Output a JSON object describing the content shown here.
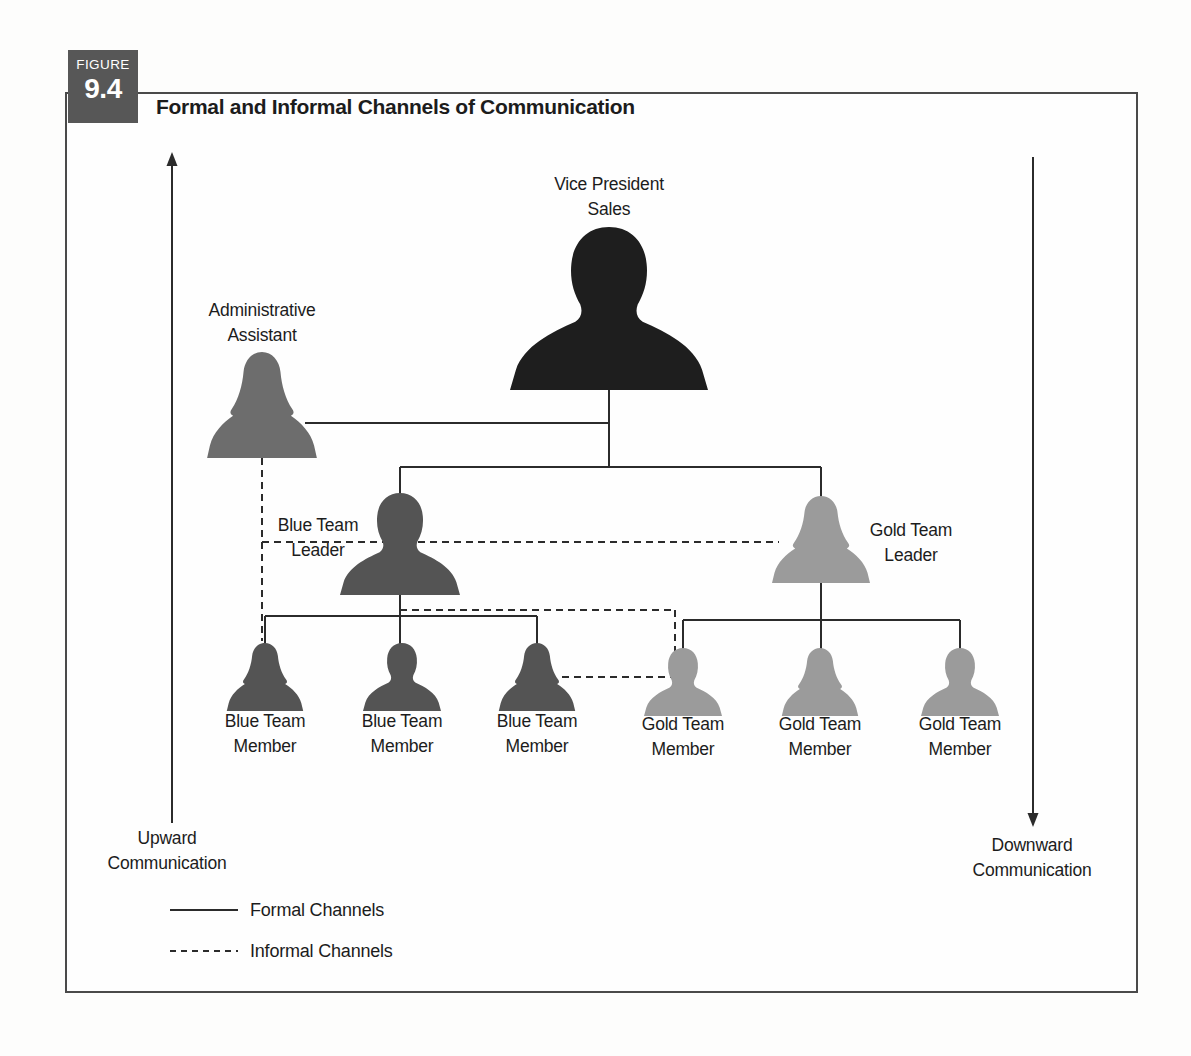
{
  "figure": {
    "label": "FIGURE",
    "number": "9.4",
    "title": "Formal and Informal Channels of Communication"
  },
  "colors": {
    "vp": "#1e1e1e",
    "admin": "#6d6d6d",
    "blue": "#545454",
    "gold": "#9b9b9b",
    "line": "#2b2b2b",
    "badge_bg": "#575757",
    "badge_text": "#ffffff"
  },
  "diagram": {
    "people": [
      {
        "id": "vp-sales",
        "role": "Vice President Sales",
        "gender": "male",
        "color": "vp",
        "cx": 609,
        "top": 227,
        "w": 198,
        "h": 163
      },
      {
        "id": "admin-assistant",
        "role": "Administrative Assistant",
        "gender": "female",
        "color": "admin",
        "cx": 262,
        "top": 352,
        "w": 112,
        "h": 106
      },
      {
        "id": "blue-team-leader",
        "role": "Blue Team Leader",
        "gender": "male",
        "color": "blue",
        "cx": 400,
        "top": 493,
        "w": 120,
        "h": 102
      },
      {
        "id": "gold-team-leader",
        "role": "Gold Team Leader",
        "gender": "female",
        "color": "gold",
        "cx": 821,
        "top": 496,
        "w": 100,
        "h": 87
      },
      {
        "id": "blue-team-member-1",
        "role": "Blue Team Member",
        "gender": "female",
        "color": "blue",
        "cx": 265,
        "top": 643,
        "w": 78,
        "h": 68
      },
      {
        "id": "blue-team-member-2",
        "role": "Blue Team Member",
        "gender": "male",
        "color": "blue",
        "cx": 402,
        "top": 643,
        "w": 78,
        "h": 68
      },
      {
        "id": "blue-team-member-3",
        "role": "Blue Team Member",
        "gender": "female",
        "color": "blue",
        "cx": 537,
        "top": 643,
        "w": 78,
        "h": 68
      },
      {
        "id": "gold-team-member-1",
        "role": "Gold Team Member",
        "gender": "male",
        "color": "gold",
        "cx": 683,
        "top": 648,
        "w": 78,
        "h": 68
      },
      {
        "id": "gold-team-member-2",
        "role": "Gold Team Member",
        "gender": "female",
        "color": "gold",
        "cx": 820,
        "top": 648,
        "w": 78,
        "h": 68
      },
      {
        "id": "gold-team-member-3",
        "role": "Gold Team Member",
        "gender": "male",
        "color": "gold",
        "cx": 960,
        "top": 648,
        "w": 78,
        "h": 68
      }
    ],
    "labels": [
      {
        "id": "vp-sales",
        "lines": [
          "Vice President",
          "Sales"
        ],
        "cx": 609,
        "top": 172
      },
      {
        "id": "admin-assistant",
        "lines": [
          "Administrative",
          "Assistant"
        ],
        "cx": 262,
        "top": 298
      },
      {
        "id": "blue-team-leader",
        "lines": [
          "Blue Team",
          "Leader"
        ],
        "cx": 318,
        "top": 513
      },
      {
        "id": "gold-team-leader",
        "lines": [
          "Gold Team",
          "Leader"
        ],
        "cx": 911,
        "top": 518
      },
      {
        "id": "blue-team-member-1",
        "lines": [
          "Blue Team",
          "Member"
        ],
        "cx": 265,
        "top": 709
      },
      {
        "id": "blue-team-member-2",
        "lines": [
          "Blue Team",
          "Member"
        ],
        "cx": 402,
        "top": 709
      },
      {
        "id": "blue-team-member-3",
        "lines": [
          "Blue Team",
          "Member"
        ],
        "cx": 537,
        "top": 709
      },
      {
        "id": "gold-team-member-1",
        "lines": [
          "Gold Team",
          "Member"
        ],
        "cx": 683,
        "top": 712
      },
      {
        "id": "gold-team-member-2",
        "lines": [
          "Gold Team",
          "Member"
        ],
        "cx": 820,
        "top": 712
      },
      {
        "id": "gold-team-member-3",
        "lines": [
          "Gold Team",
          "Member"
        ],
        "cx": 960,
        "top": 712
      },
      {
        "id": "upward-communication",
        "lines": [
          "Upward",
          "Communication"
        ],
        "cx": 167,
        "top": 826
      },
      {
        "id": "downward-communication",
        "lines": [
          "Downward",
          "Communication"
        ],
        "cx": 1032,
        "top": 833
      }
    ],
    "formal_channels": [
      {
        "id": "vp-drop",
        "x1": 609,
        "y1": 390,
        "x2": 609,
        "y2": 467
      },
      {
        "id": "admin-to-vp",
        "x1": 305,
        "y1": 423,
        "x2": 609,
        "y2": 423
      },
      {
        "id": "leaders-branch",
        "x1": 400,
        "y1": 467,
        "x2": 821,
        "y2": 467
      },
      {
        "id": "blue-leader-drop",
        "x1": 400,
        "y1": 467,
        "x2": 400,
        "y2": 494
      },
      {
        "id": "gold-leader-drop",
        "x1": 821,
        "y1": 467,
        "x2": 821,
        "y2": 497
      },
      {
        "id": "blue-leader-to-members",
        "x1": 400,
        "y1": 594,
        "x2": 400,
        "y2": 644
      },
      {
        "id": "blue-members-branch",
        "x1": 265,
        "y1": 616,
        "x2": 537,
        "y2": 616
      },
      {
        "id": "blue-member1-drop",
        "x1": 265,
        "y1": 616,
        "x2": 265,
        "y2": 644
      },
      {
        "id": "blue-member3-drop",
        "x1": 537,
        "y1": 616,
        "x2": 537,
        "y2": 644
      },
      {
        "id": "gold-leader-to-members",
        "x1": 821,
        "y1": 582,
        "x2": 821,
        "y2": 649
      },
      {
        "id": "gold-members-branch",
        "x1": 683,
        "y1": 620,
        "x2": 960,
        "y2": 620
      },
      {
        "id": "gold-member1-drop",
        "x1": 683,
        "y1": 620,
        "x2": 683,
        "y2": 649
      },
      {
        "id": "gold-member3-drop",
        "x1": 960,
        "y1": 620,
        "x2": 960,
        "y2": 649
      }
    ],
    "informal_channels": [
      {
        "id": "admin-down",
        "x1": 262,
        "y1": 458,
        "x2": 262,
        "y2": 641
      },
      {
        "id": "admin-leaders-cross",
        "x1": 262,
        "y1": 542,
        "x2": 779,
        "y2": 542
      },
      {
        "id": "blueleader-right",
        "x1": 400,
        "y1": 610,
        "x2": 675,
        "y2": 610
      },
      {
        "id": "loop-down",
        "x1": 675,
        "y1": 610,
        "x2": 675,
        "y2": 677
      },
      {
        "id": "bluemember3-to-goldmember1",
        "x1": 562,
        "y1": 677,
        "x2": 673,
        "y2": 677
      }
    ],
    "arrows": [
      {
        "id": "upward-arrow",
        "x": 172,
        "tail_y": 823,
        "tip_y": 152,
        "dir": "up"
      },
      {
        "id": "downward-arrow",
        "x": 1033,
        "tail_y": 157,
        "tip_y": 827,
        "dir": "down"
      }
    ]
  },
  "legend": {
    "formal_label": "Formal Channels",
    "informal_label": "Informal Channels",
    "formal_swatch": {
      "x1": 170,
      "y1": 910,
      "x2": 238,
      "y2": 910
    },
    "informal_swatch": {
      "x1": 170,
      "y1": 951,
      "x2": 238,
      "y2": 951
    }
  }
}
